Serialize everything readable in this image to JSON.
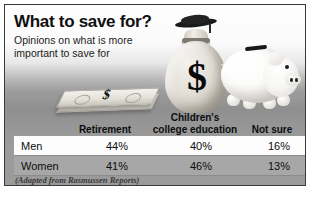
{
  "headline": {
    "title": "What to save for?",
    "subtitle_line1": "Opinions on what is more",
    "subtitle_line2": "important to save for"
  },
  "artwork": {
    "money_bag_symbol": "$",
    "cash_stack_symbol": "$"
  },
  "source_note": "(Adapted from Rasmussen Reports)",
  "chart_data": {
    "type": "table",
    "title": "What to save for?",
    "subtitle": "Opinions on what is more important to save for",
    "columns": [
      "",
      "Retirement",
      "Children's college education",
      "Not sure"
    ],
    "column_headers_display": {
      "retirement": "Retirement",
      "college_line1": "Children's",
      "college_line2": "college education",
      "not_sure": "Not sure"
    },
    "rows": [
      {
        "group": "Men",
        "retirement": "44%",
        "college": "40%",
        "not_sure": "16%"
      },
      {
        "group": "Women",
        "retirement": "41%",
        "college": "46%",
        "not_sure": "13%"
      }
    ],
    "values": {
      "men": [
        44,
        40,
        16
      ],
      "women": [
        41,
        46,
        13
      ]
    },
    "units": "percent",
    "source": "(Adapted from Rasmussen Reports)",
    "xlabel": "",
    "ylabel": "",
    "legend": [
      "Men",
      "Women"
    ],
    "grid": false
  },
  "colors": {
    "frame_border": "#3a3a3a",
    "row_men_bg": "#fdfdfd",
    "row_women_bg": "#a7a7a7",
    "text": "#0d0d0d"
  }
}
